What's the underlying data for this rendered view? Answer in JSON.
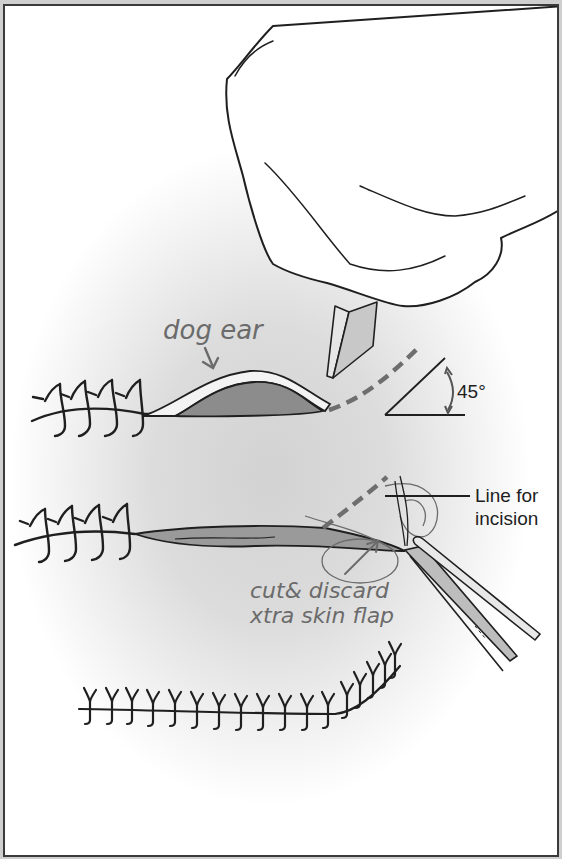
{
  "figure": {
    "labels": {
      "dog_ear": "dog ear",
      "angle": "45°",
      "line_for": "Line for",
      "incision": "incision",
      "cut_discard": "cut& discard",
      "skin_flap": "xtra skin flap"
    },
    "panels": [
      {
        "name": "dog-ear-identification",
        "stitches_visible": 4
      },
      {
        "name": "incision-and-excision",
        "stitches_visible": 4
      },
      {
        "name": "closed-wound",
        "stitches_visible": 16
      }
    ],
    "colors": {
      "ink": "#1f1f1f",
      "dashed_line": "#6e6e6e",
      "dog_ear_fill": "#8c8c8c",
      "handwriting": "#6b6b6b",
      "frame": "#3a3a3a"
    }
  }
}
